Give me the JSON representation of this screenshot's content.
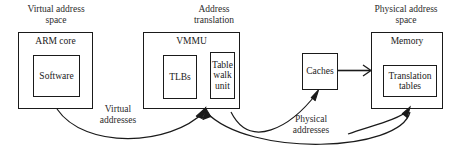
{
  "figure": {
    "type": "block-diagram",
    "line_color": "#1a1a1a",
    "background": "#ffffff"
  },
  "sections": [
    {
      "id": "virtual-address-space",
      "title": "Virtual address\nspace"
    },
    {
      "id": "address-translation",
      "title": "Address\ntranslation"
    },
    {
      "id": "physical-address-space",
      "title": "Physical address\nspace"
    }
  ],
  "boxes": [
    {
      "id": "arm-core",
      "label": "ARM core",
      "children": [
        {
          "id": "software",
          "label": "Software"
        }
      ]
    },
    {
      "id": "vmmu",
      "label": "VMMU",
      "children": [
        {
          "id": "tlbs",
          "label": "TLBs"
        },
        {
          "id": "table-walk-unit",
          "label": "Table\nwalk\nunit"
        }
      ]
    },
    {
      "id": "caches",
      "label": "Caches",
      "children": []
    },
    {
      "id": "memory",
      "label": "Memory",
      "children": [
        {
          "id": "translation-tables",
          "label": "Translation\ntables"
        }
      ]
    }
  ],
  "flows": [
    {
      "id": "virtual-addresses",
      "label": "Virtual\naddresses",
      "from": "arm-core",
      "to": "vmmu"
    },
    {
      "id": "physical-addresses",
      "label": "Physical\naddresses",
      "from": "vmmu",
      "to": "caches"
    },
    {
      "id": "table-walk-fetch",
      "label": "",
      "from": "memory",
      "to": "vmmu"
    },
    {
      "id": "cache-to-memory",
      "label": "",
      "from": "caches",
      "to": "memory"
    }
  ]
}
